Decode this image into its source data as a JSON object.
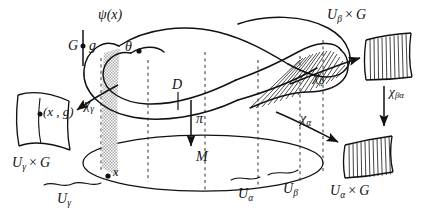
{
  "figure": {
    "name": "principal-fiber-bundle-diagram",
    "background_color": "#ffffff",
    "ink_color": "#111111",
    "shade_color": "#b9b9b9"
  },
  "labels": {
    "psi_x": "ψ(x)",
    "group_G": "G",
    "group_element_g": "g",
    "theta": "θ",
    "total_space_D": "D",
    "projection_pi": "π",
    "base_M": "M",
    "point_x": "x",
    "chi_gamma": "χ",
    "chi_gamma_sub": "γ",
    "chi_alpha": "χ",
    "chi_alpha_sub": "α",
    "chi_beta": "χ",
    "chi_beta_sub": "β",
    "chi_beta_alpha": "χ",
    "chi_beta_alpha_sub": "βα",
    "pair_x_g": "(x , g)",
    "U_gamma_times_G": "U",
    "U_gamma_times_G_sub": "γ",
    "U_alpha_times_G": "U",
    "U_alpha_times_G_sub": "α",
    "U_beta_times_G": "U",
    "U_beta_times_G_sub": "β",
    "times_sign": "×",
    "G_factor": "G",
    "U_gamma_base": "U",
    "U_gamma_base_sub": "γ",
    "U_alpha_base": "U",
    "U_alpha_base_sub": "α",
    "U_beta_base": "U",
    "U_beta_base_sub": "β"
  },
  "icons": {
    "arrow_chi_gamma": "arrow-left-icon",
    "arrow_chi_beta": "arrow-right-icon",
    "arrow_chi_alpha": "arrow-right-down-icon",
    "arrow_chi_beta_alpha": "arrow-down-icon",
    "arrow_pi": "arrow-down-icon"
  }
}
